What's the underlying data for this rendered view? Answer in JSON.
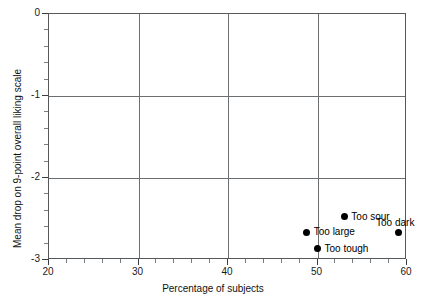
{
  "chart_data": {
    "type": "scatter",
    "title": "",
    "xlabel": "Percentage of subjects",
    "ylabel": "Mean drop on 9-point overall liking scale",
    "xlim": [
      20,
      60
    ],
    "ylim": [
      0,
      -3
    ],
    "y_inverted": true,
    "grid": true,
    "legend": "none",
    "x_ticks": [
      20,
      30,
      40,
      50,
      60
    ],
    "x_tick_labels": [
      "20",
      "30",
      "40",
      "50",
      "60"
    ],
    "x_minor_tick_step": 2,
    "y_ticks": [
      0,
      -1,
      -2,
      -3
    ],
    "y_tick_labels": [
      "0",
      "-1",
      "-2",
      "-3"
    ],
    "y_minor_tick_step": 0.2,
    "points": [
      {
        "label": "Too tough",
        "x": 50.0,
        "y": -2.86,
        "label_position": "right"
      },
      {
        "label": "Too large",
        "x": 48.8,
        "y": -2.66,
        "label_position": "right"
      },
      {
        "label": "Too sour",
        "x": 53.0,
        "y": -2.47,
        "label_position": "right"
      },
      {
        "label": "Too dark",
        "x": 59.0,
        "y": -2.67,
        "label_position": "above"
      }
    ],
    "marker_color": "#000000",
    "grid_color": "#6b6f72",
    "axis_color": "#55595c"
  },
  "footer": {
    "artifact_text": ""
  }
}
